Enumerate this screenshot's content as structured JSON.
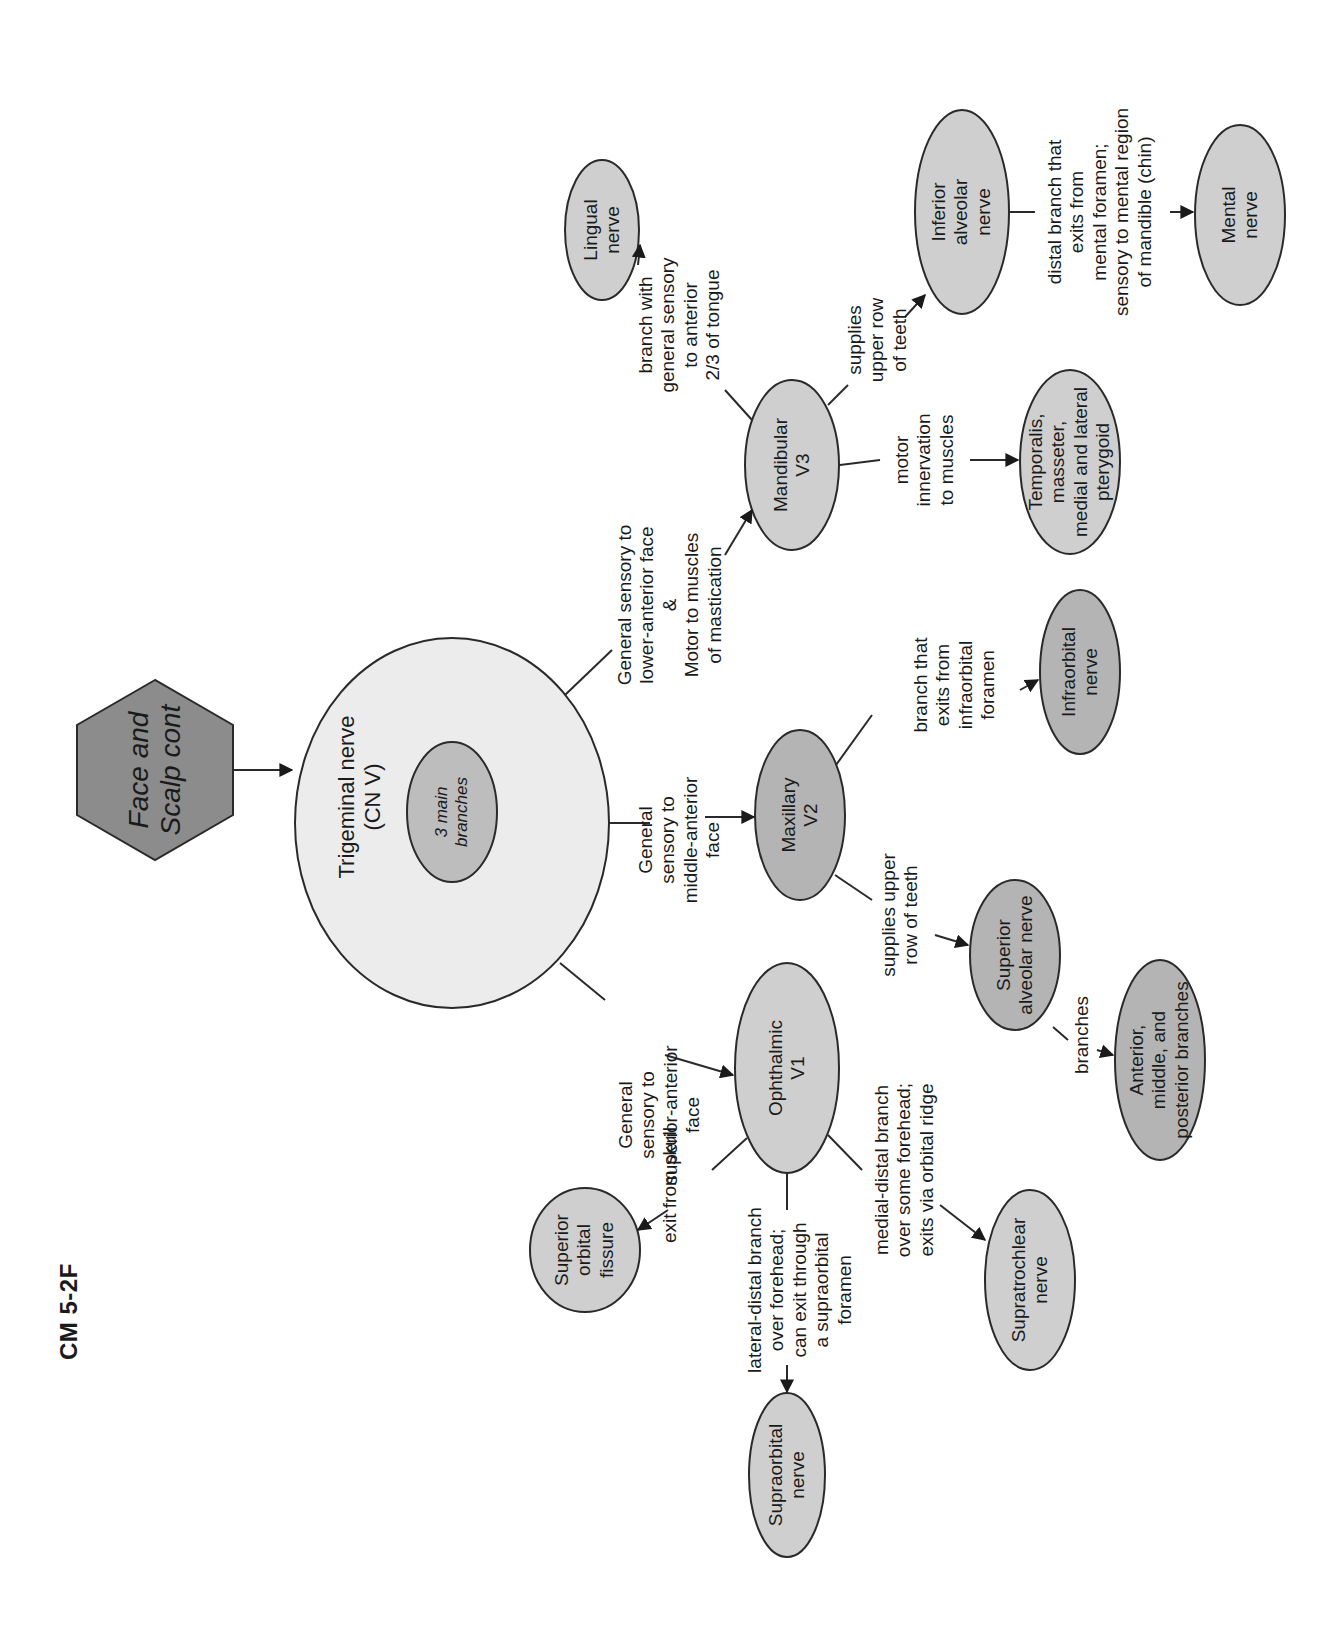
{
  "figure_id": "CM 5-2F",
  "root": {
    "label": "Face and\nScalp cont",
    "shape": "hexagon",
    "fill": "#8c8c8c"
  },
  "trigeminal": {
    "label": "Trigeminal nerve\n(CN V)",
    "inner_label": "3 main\nbranches",
    "fill": "#ececec",
    "inner_fill": "#bdbdbd"
  },
  "branches": {
    "v1": {
      "node": "Ophthalmic\nV1",
      "edge": "General\nsensory to\nsuperior-anterior\nface",
      "children": [
        {
          "node": "Superior\norbital\nfissure",
          "edge": "exit from skull"
        },
        {
          "node": "Supraorbital\nnerve",
          "edge": "lateral-distal branch\nover forehead;\ncan exit through\na supraorbital\nforamen"
        },
        {
          "node": "Supratrochlear\nnerve",
          "edge": "medial-distal branch\nover some forehead;\nexits via orbital ridge"
        }
      ]
    },
    "v2": {
      "node": "Maxillary\nV2",
      "edge": "General\nsensory to\nmiddle-anterior\nface",
      "children": [
        {
          "node": "Superior\nalveolar nerve",
          "edge": "supplies upper\nrow of teeth",
          "children": [
            {
              "node": "Anterior,\nmiddle, and\nposterior branches",
              "edge": "branches"
            }
          ]
        },
        {
          "node": "Infraorbital\nnerve",
          "edge": "branch that\nexits from\ninfraorbital\nforamen"
        }
      ]
    },
    "v3": {
      "node": "Mandibular\nV3",
      "edge": "General sensory to\nlower-anterior face\n&\nMotor to muscles\nof mastication",
      "children": [
        {
          "node": "Lingual\nnerve",
          "edge": "branch with\ngeneral sensory\nto anterior\n2/3 of tongue"
        },
        {
          "node": "Inferior\nalveolar\nnerve",
          "edge": "supplies\nupper row\nof teeth",
          "children": [
            {
              "node": "Mental\nnerve",
              "edge": "distal branch that\nexits from\nmental foramen;\nsensory to mental region\nof mandible (chin)"
            }
          ]
        },
        {
          "node": "Temporalis,\nmasseter,\nmedial and lateral\npterygoid",
          "edge": "motor\ninnervation\nto muscles"
        }
      ]
    }
  },
  "colors": {
    "node_fill": "#cfcfcf",
    "node_dark_fill": "#b4b4b4",
    "stroke": "#2a2a2a",
    "background": "#ffffff"
  }
}
